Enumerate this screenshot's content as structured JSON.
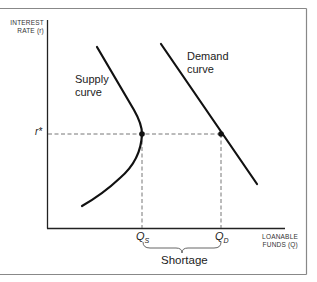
{
  "diagram": {
    "y_axis_label_line1": "INTEREST",
    "y_axis_label_line2": "RATE (r)",
    "x_axis_label_line1": "LOANABLE",
    "x_axis_label_line2": "FUNDS (Q)",
    "r_star_label": "r*",
    "supply_label_line1": "Supply",
    "supply_label_line2": "curve",
    "demand_label_line1": "Demand",
    "demand_label_line2": "curve",
    "qs_label": "Q",
    "qs_sub": "S",
    "qd_label": "Q",
    "qd_sub": "D",
    "shortage_label": "Shortage",
    "colors": {
      "line": "#111111",
      "dash": "#666666",
      "frame": "#888888"
    }
  }
}
